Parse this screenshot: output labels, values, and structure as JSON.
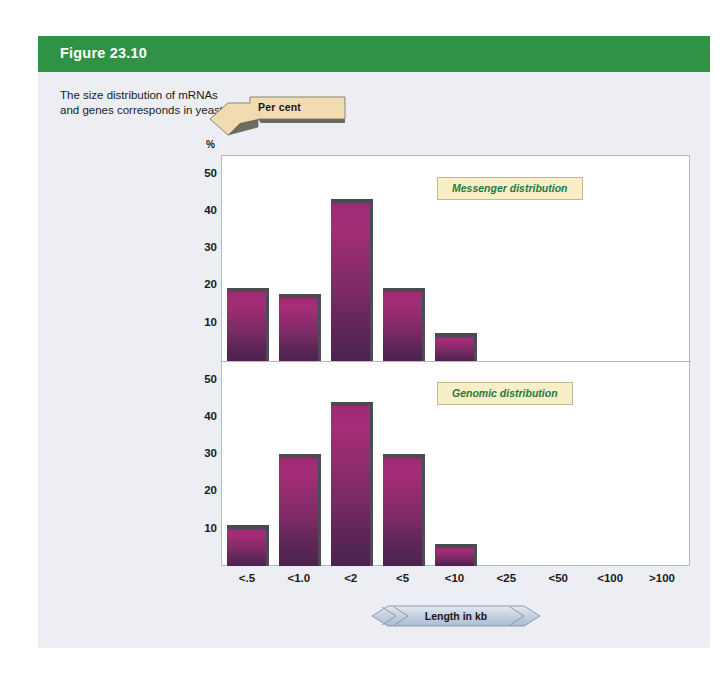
{
  "figure": {
    "header_title": "Figure 23.10",
    "caption": "The size distribution of mRNAs and genes corresponds in yeast.",
    "header_color": "#2f9245",
    "card_background": "#eceef4"
  },
  "axes": {
    "y_axis_banner_label": "Per cent",
    "y_axis_unit_symbol": "%",
    "x_axis_banner_label": "Length in kb",
    "y_ticks": [
      50,
      40,
      30,
      20,
      10
    ],
    "y_max": 55,
    "x_categories": [
      "<.5",
      "<1.0",
      "<2",
      "<5",
      "<10",
      "<25",
      "<50",
      "<100",
      ">100"
    ]
  },
  "legend": {
    "top_label": "Messenger distribution",
    "bottom_label": "Genomic distribution",
    "box_fill": "#f8efc8",
    "text_color": "#1f7a3a"
  },
  "colors": {
    "bar_top": "#a62d77",
    "bar_bottom": "#4b2350",
    "bar_cap": "#4a4a50",
    "frame_border": "#d9a8bd",
    "banner_fill": "#f0dcb0",
    "length_banner_fill": "#ccd6e4"
  },
  "chart_data": [
    {
      "type": "bar",
      "title": "Messenger distribution",
      "xlabel": "Length in kb",
      "ylabel": "Per cent",
      "categories": [
        "<.5",
        "<1.0",
        "<2",
        "<5",
        "<10",
        "<25",
        "<50",
        "<100",
        ">100"
      ],
      "values": [
        19.5,
        18,
        43.5,
        19.5,
        7.5,
        0,
        0,
        0,
        0
      ],
      "ylim": [
        0,
        55
      ],
      "yticks": [
        10,
        20,
        30,
        40,
        50
      ],
      "grid": false,
      "legend_position": "top-right"
    },
    {
      "type": "bar",
      "title": "Genomic distribution",
      "xlabel": "Length in kb",
      "ylabel": "Per cent",
      "categories": [
        "<.5",
        "<1.0",
        "<2",
        "<5",
        "<10",
        "<25",
        "<50",
        "<100",
        ">100"
      ],
      "values": [
        11,
        30,
        44,
        30,
        6,
        0,
        0,
        0,
        0
      ],
      "ylim": [
        0,
        55
      ],
      "yticks": [
        10,
        20,
        30,
        40,
        50
      ],
      "grid": false,
      "legend_position": "top-right"
    }
  ]
}
